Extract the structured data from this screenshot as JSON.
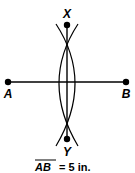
{
  "diagram": {
    "points": {
      "A": {
        "label": "A",
        "x": 8,
        "y": 82
      },
      "B": {
        "label": "B",
        "x": 126,
        "y": 82
      },
      "X": {
        "label": "X",
        "x": 67,
        "y": 25
      },
      "Y": {
        "label": "Y",
        "x": 67,
        "y": 139
      }
    },
    "segment_name": "AB",
    "caption_value": "= 5 in.",
    "colors": {
      "stroke": "#000000",
      "background": "#ffffff"
    }
  }
}
